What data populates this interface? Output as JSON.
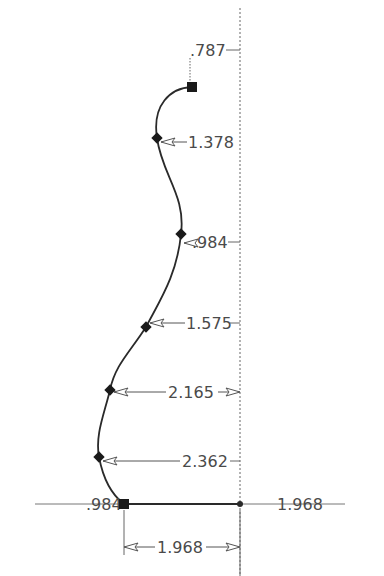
{
  "drawing": {
    "type": "spline-profile-dimensions",
    "colors": {
      "curve": "#2a2a2a",
      "dim": "#555555",
      "text": "#4a4a4a",
      "background": "#ffffff"
    },
    "dimensions": {
      "top_offset": ".787",
      "p1": "1.378",
      "p2": ".984",
      "p3": "1.575",
      "p4": "2.165",
      "p5": "2.362",
      "base_left": ".984",
      "base_right": "1.968",
      "bottom_width": "1.968"
    },
    "points": [
      {
        "name": "start",
        "marker": "square",
        "x": 192,
        "y": 87
      },
      {
        "name": "p1",
        "marker": "diamond",
        "x": 157,
        "y": 138
      },
      {
        "name": "p2",
        "marker": "diamond",
        "x": 181,
        "y": 234
      },
      {
        "name": "p3",
        "marker": "diamond",
        "x": 146,
        "y": 327
      },
      {
        "name": "p4",
        "marker": "diamond",
        "x": 110,
        "y": 390
      },
      {
        "name": "p5",
        "marker": "diamond",
        "x": 99,
        "y": 457
      },
      {
        "name": "end",
        "marker": "square",
        "x": 124,
        "y": 504
      }
    ]
  }
}
